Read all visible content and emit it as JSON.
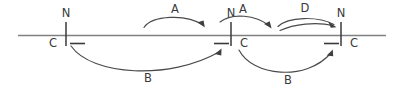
{
  "diagram": {
    "type": "timeline-with-transition-arcs",
    "baseline": {
      "label": "horizontal-timeline",
      "x_start": 18,
      "x_end": 386,
      "y": 35,
      "color": "#7f8083"
    },
    "nodes": [
      {
        "id": "node-1",
        "tick_x": 66,
        "upper_label": "N",
        "lower_label": "C",
        "upper_label_x": 66,
        "upper_label_y": 17,
        "lower_label_x": 53,
        "lower_label_y": 47,
        "dash_side": "right"
      },
      {
        "id": "node-2",
        "tick_x": 231,
        "upper_label": "N",
        "lower_label": "C",
        "upper_label_x": 231,
        "upper_label_y": 17,
        "lower_label_x": 244,
        "lower_label_y": 47,
        "dash_side": "left"
      },
      {
        "id": "node-3",
        "tick_x": 341,
        "upper_label": "N",
        "lower_label": "C",
        "upper_label_x": 341,
        "upper_label_y": 17,
        "lower_label_x": 354,
        "lower_label_y": 47,
        "dash_side": "left"
      }
    ],
    "arcs": [
      {
        "id": "arc-a-1",
        "label": "A",
        "label_x": 175,
        "label_y": 13,
        "position": "above",
        "from_node": "node-1-region",
        "to_node": "node-2",
        "direction": "rightward"
      },
      {
        "id": "arc-a-2",
        "label": "A",
        "label_x": 243,
        "label_y": 13,
        "position": "above",
        "from_node": "node-2",
        "to_node": "node-3-region",
        "direction": "rightward"
      },
      {
        "id": "arc-d-1",
        "label": "D",
        "label_x": 305,
        "label_y": 12,
        "position": "above",
        "from_node": "node-2-region",
        "to_node": "node-3",
        "direction": "rightward",
        "double_stroke": true
      },
      {
        "id": "arc-b-1",
        "label": "B",
        "label_x": 148,
        "label_y": 82,
        "position": "below",
        "from_node": "node-1",
        "to_node": "node-2",
        "direction": "rightward"
      },
      {
        "id": "arc-b-2",
        "label": "B",
        "label_x": 288,
        "label_y": 84,
        "position": "below",
        "from_node": "node-2",
        "to_node": "node-3",
        "direction": "rightward"
      }
    ],
    "colors": {
      "background": "#ffffff",
      "baseline": "#7f8083",
      "ink": "#3a3a3c",
      "arc": "#4a4a4d"
    }
  }
}
